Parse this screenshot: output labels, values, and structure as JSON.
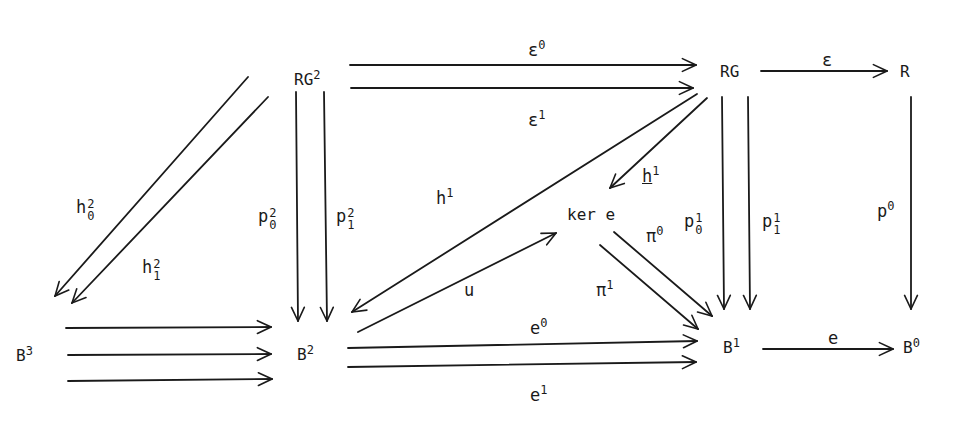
{
  "nodes": {
    "RG2": {
      "base": "RG",
      "sup": "2"
    },
    "RG": {
      "base": "RG"
    },
    "R": {
      "base": "R"
    },
    "B3": {
      "base": "B",
      "sup": "3"
    },
    "B2": {
      "base": "B",
      "sup": "2"
    },
    "kere": {
      "base": "ker e"
    },
    "B1": {
      "base": "B",
      "sup": "1"
    },
    "B0": {
      "base": "B",
      "sup": "0"
    }
  },
  "arrows": {
    "eps0": {
      "base": "ε",
      "sup": "0",
      "from": "RG^2",
      "to": "RG"
    },
    "eps1": {
      "base": "ε",
      "sup": "1",
      "from": "RG^2",
      "to": "RG"
    },
    "eps": {
      "base": "ε",
      "from": "RG",
      "to": "R"
    },
    "h0_2": {
      "base": "h",
      "sup": "2",
      "sub": "0",
      "from": "RG^2",
      "to": "B^3"
    },
    "h1_2": {
      "base": "h",
      "sup": "2",
      "sub": "1",
      "from": "RG^2",
      "to": "B^3"
    },
    "p0_2": {
      "base": "p",
      "sup": "2",
      "sub": "0",
      "from": "RG^2",
      "to": "B^2"
    },
    "p1_2": {
      "base": "p",
      "sup": "2",
      "sub": "1",
      "from": "RG^2",
      "to": "B^2"
    },
    "h1": {
      "base": "h",
      "sup": "1",
      "from": "RG",
      "to": "B^2"
    },
    "h1_under": {
      "base": "h",
      "sup": "1",
      "underlined": true,
      "from": "RG",
      "to": "ker e"
    },
    "p0_1": {
      "base": "p",
      "sup": "1",
      "sub": "0",
      "from": "RG",
      "to": "B^1"
    },
    "p1_1": {
      "base": "p",
      "sup": "1",
      "sub": "1",
      "from": "RG",
      "to": "B^1"
    },
    "p0": {
      "base": "p",
      "sup": "0",
      "from": "R",
      "to": "B^0"
    },
    "u": {
      "base": "u",
      "from": "B^2",
      "to": "ker e"
    },
    "pi0": {
      "base": "π",
      "sup": "0",
      "from": "ker e",
      "to": "B^1"
    },
    "pi1": {
      "base": "π",
      "sup": "1",
      "from": "ker e",
      "to": "B^1"
    },
    "e0": {
      "base": "e",
      "sup": "0",
      "from": "B^2",
      "to": "B^1"
    },
    "e1": {
      "base": "e",
      "sup": "1",
      "from": "B^2",
      "to": "B^1"
    },
    "e": {
      "base": "e",
      "from": "B^1",
      "to": "B^0"
    },
    "b3_to_b2": {
      "count": 3,
      "from": "B^3",
      "to": "B^2"
    }
  }
}
